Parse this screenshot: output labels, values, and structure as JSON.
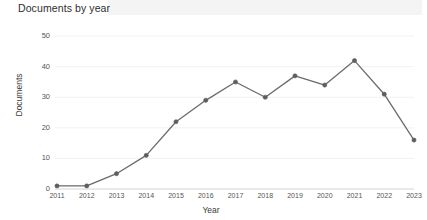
{
  "header": {
    "title": "Documents by year"
  },
  "chart_data": {
    "type": "line",
    "title": "Documents by year",
    "xlabel": "Year",
    "ylabel": "Documents",
    "categories": [
      "2011",
      "2012",
      "2013",
      "2014",
      "2015",
      "2016",
      "2017",
      "2018",
      "2019",
      "2020",
      "2021",
      "2022",
      "2023"
    ],
    "values": [
      1,
      1,
      5,
      11,
      22,
      29,
      35,
      30,
      37,
      34,
      42,
      31,
      16
    ],
    "series": [
      {
        "name": "Documents",
        "values": [
          1,
          1,
          5,
          11,
          22,
          29,
          35,
          30,
          37,
          34,
          42,
          31,
          16
        ]
      }
    ],
    "yticks": [
      0,
      10,
      20,
      30,
      40,
      50
    ],
    "ylim": [
      0,
      52
    ],
    "xlim": [
      "2011",
      "2023"
    ],
    "grid": true,
    "legend": false,
    "line_color": "#6b6b6b",
    "marker_color": "#5e5e5e",
    "grid_color": "#ededed",
    "background": "#ffffff"
  }
}
